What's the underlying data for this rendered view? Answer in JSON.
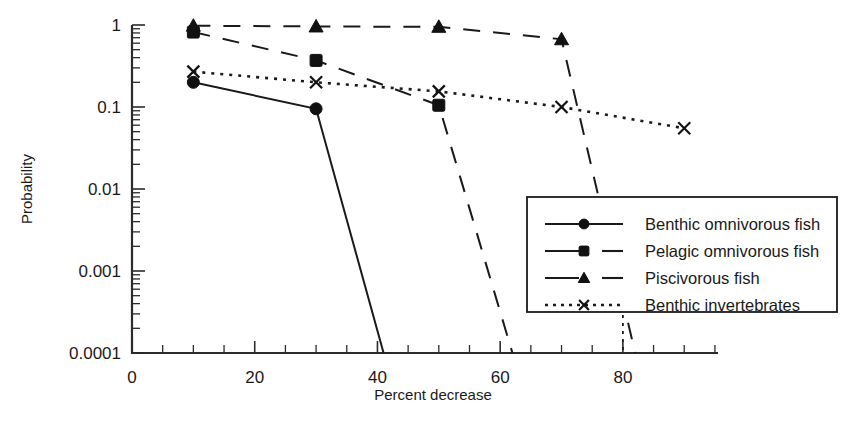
{
  "chart_data": {
    "type": "line",
    "title": "",
    "xlabel": "Percent decrease",
    "ylabel": "Probability",
    "yscale": "log",
    "ylim": [
      0.0001,
      1
    ],
    "xlim": [
      0,
      95
    ],
    "xticks": [
      0,
      20,
      40,
      60,
      80
    ],
    "xtick_labels": [
      "0",
      "20",
      "40",
      "60",
      "80"
    ],
    "xminor_step": 5,
    "yticks": [
      1,
      0.1,
      0.01,
      0.001,
      0.0001
    ],
    "ytick_labels": [
      "1",
      "0.1",
      "0.01",
      "0.001",
      "0.0001"
    ],
    "grid": false,
    "legend_position": "lower right",
    "series": [
      {
        "name": "Benthic omnivorous fish",
        "marker": "circle",
        "linestyle": "solid",
        "x": [
          10,
          30,
          41
        ],
        "y": [
          0.2,
          0.095,
          0.0001
        ],
        "marker_x": [
          10,
          30
        ],
        "marker_y": [
          0.2,
          0.095
        ]
      },
      {
        "name": "Pelagic omnivorous fish",
        "marker": "square",
        "linestyle": "dashed",
        "x": [
          10,
          30,
          50,
          62
        ],
        "y": [
          0.82,
          0.37,
          0.105,
          0.0001
        ],
        "marker_x": [
          10,
          30,
          50
        ],
        "marker_y": [
          0.82,
          0.37,
          0.105
        ]
      },
      {
        "name": "Piscivorous fish",
        "marker": "triangle",
        "linestyle": "dashed",
        "x": [
          10,
          30,
          50,
          70,
          82
        ],
        "y": [
          0.98,
          0.96,
          0.95,
          0.67,
          0.0001
        ],
        "marker_x": [
          10,
          30,
          50,
          70
        ],
        "marker_y": [
          0.98,
          0.96,
          0.95,
          0.67
        ]
      },
      {
        "name": "Benthic invertebrates",
        "marker": "x",
        "linestyle": "dotted",
        "x": [
          10,
          30,
          50,
          70,
          90
        ],
        "y": [
          0.27,
          0.2,
          0.155,
          0.1,
          0.055
        ],
        "marker_x": [
          10,
          30,
          50,
          70,
          90
        ],
        "marker_y": [
          0.27,
          0.2,
          0.155,
          0.1,
          0.055
        ]
      }
    ],
    "annotations": [
      {
        "name": "dotted-vertical-marker",
        "x": 80,
        "description": "short dotted vertical segment at bottom axis near 80"
      }
    ]
  },
  "legend": {
    "entries": [
      {
        "label": "Benthic omnivorous fish",
        "marker": "circle",
        "linestyle": "solid"
      },
      {
        "label": "Pelagic omnivorous fish",
        "marker": "square",
        "linestyle": "dashed"
      },
      {
        "label": "Piscivorous fish",
        "marker": "triangle",
        "linestyle": "dashed"
      },
      {
        "label": "Benthic invertebrates",
        "marker": "x",
        "linestyle": "dotted"
      }
    ]
  },
  "colors": {
    "ink": "#1a1a1a",
    "background": "#ffffff"
  }
}
